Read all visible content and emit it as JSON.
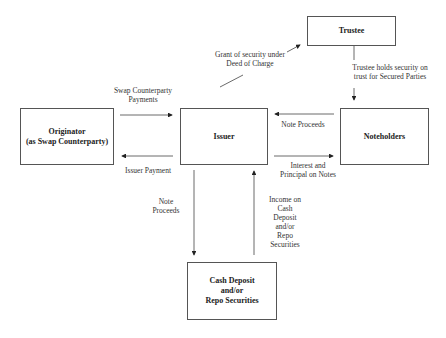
{
  "nodes": {
    "trustee": "Trustee",
    "originator_line1": "Originator",
    "originator_line2": "(as Swap Counterparty)",
    "issuer": "Issuer",
    "noteholders": "Noteholders",
    "cash_line1": "Cash Deposit",
    "cash_line2": "and/or",
    "cash_line3": "Repo Securities"
  },
  "edges": {
    "grant_line1": "Grant of security under",
    "grant_line2": "Deed of Charge",
    "trustee_holds_line1": "Trustee holds security on",
    "trustee_holds_line2": "trust for Secured Parties",
    "swap_payments_line1": "Swap Counterparty",
    "swap_payments_line2": "Payments",
    "issuer_payment": "Issuer Payment",
    "note_proceeds_in": "Note Proceeds",
    "interest_line1": "Interest and",
    "interest_line2": "Principal on Notes",
    "note_proceeds_down_line1": "Note",
    "note_proceeds_down_line2": "Proceeds",
    "income_line1": "Income on",
    "income_line2": "Cash",
    "income_line3": "Deposit",
    "income_line4": "and/or",
    "income_line5": "Repo",
    "income_line6": "Securities"
  }
}
